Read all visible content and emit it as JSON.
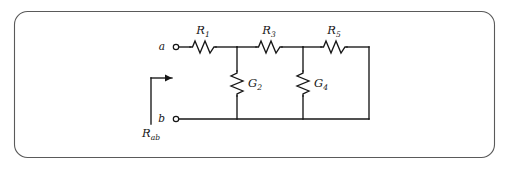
{
  "figure": {
    "border_color": "#5a5a5a",
    "wire_color": "#161616",
    "background": "#ffffff"
  },
  "terminals": [
    {
      "id": "a",
      "label": "a",
      "x": 168,
      "y": 47
    },
    {
      "id": "b",
      "label": "b",
      "x": 168,
      "y": 119
    }
  ],
  "series_resistors": [
    {
      "id": "R1",
      "symbol": "R",
      "subscript": "1",
      "x": 203,
      "y": 47
    },
    {
      "id": "R3",
      "symbol": "R",
      "subscript": "3",
      "x": 269,
      "y": 47
    },
    {
      "id": "R5",
      "symbol": "R",
      "subscript": "5",
      "x": 334,
      "y": 47
    }
  ],
  "shunt_conductances": [
    {
      "id": "G2",
      "symbol": "G",
      "subscript": "2",
      "x": 237,
      "y": 83
    },
    {
      "id": "G4",
      "symbol": "G",
      "subscript": "4",
      "x": 303,
      "y": 83
    }
  ],
  "input_resistance": {
    "symbol": "R",
    "subscript": "ab",
    "label_x": 151,
    "label_y": 133,
    "arrow_direction": "right"
  },
  "nodes": {
    "top_rail_y": 47,
    "bottom_rail_y": 119,
    "left_x": 176,
    "right_x": 369,
    "junction_x": [
      237,
      303
    ]
  }
}
